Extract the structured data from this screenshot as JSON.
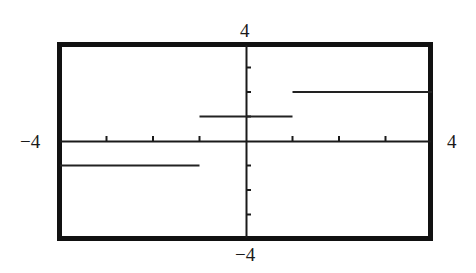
{
  "chart_data": {
    "type": "line",
    "title": "",
    "xlabel": "",
    "ylabel": "",
    "xlim": [
      -4,
      4
    ],
    "ylim": [
      -4,
      4
    ],
    "x_tick_step": 1,
    "y_tick_step": 1,
    "grid": false,
    "legend": null,
    "axis_labels": {
      "x_min": "−4",
      "x_max": "4",
      "y_max": "4",
      "y_min": "−4"
    },
    "series": [
      {
        "name": "step function",
        "segments": [
          {
            "x_start": -4,
            "x_end": -1,
            "y": -1
          },
          {
            "x_start": -1,
            "x_end": 1,
            "y": 1
          },
          {
            "x_start": 1,
            "x_end": 4,
            "y": 2
          }
        ]
      }
    ]
  },
  "colors": {
    "frame": "#111111",
    "axes": "#1a1a1a",
    "series": "#222222",
    "background": "#ffffff"
  }
}
